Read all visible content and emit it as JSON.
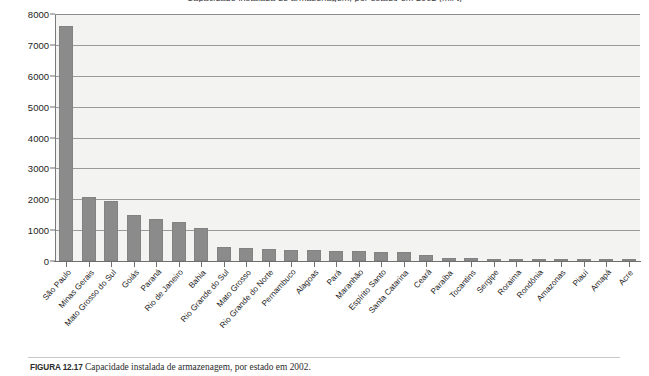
{
  "figure": {
    "title": "Capacidade instalada de armazenagem, por estado em 2002 (mil t)",
    "caption_label": "FIGURA 12.17",
    "caption_text": "Capacidade instalada de armazenagem, por estado em 2002."
  },
  "axes": {
    "y_ticks": [
      "8000",
      "7000",
      "6000",
      "5000",
      "4000",
      "3000",
      "2000",
      "1000",
      "0"
    ],
    "y_min": 0,
    "y_max": 8000,
    "y_step": 1000,
    "grid": true,
    "plot_background": "#f3f3f1",
    "bar_color": "#8b8b8b",
    "axis_color": "#6f6f6f"
  },
  "chart_data": {
    "type": "bar",
    "title": "Capacidade instalada de armazenagem, por estado em 2002 (mil t)",
    "xlabel": "",
    "ylabel": "",
    "ylim": [
      0,
      8000
    ],
    "grid": true,
    "legend": null,
    "categories": [
      "São Paulo",
      "Minas Gerais",
      "Mato Grosso do Sul",
      "Goiás",
      "Paraná",
      "Rio de Janeiro",
      "Bahia",
      "Rio Grande do Sul",
      "Mato Grosso",
      "Rio Grande do Norte",
      "Pernambuco",
      "Alagoas",
      "Pará",
      "Maranhão",
      "Espírito Santo",
      "Santa Catarina",
      "Ceará",
      "Paraíba",
      "Tocantins",
      "Sergipe",
      "Roraima",
      "Rondônia",
      "Amazonas",
      "Piauí",
      "Amapá",
      "Acre"
    ],
    "values": [
      7620,
      2060,
      1950,
      1500,
      1350,
      1260,
      1080,
      460,
      420,
      390,
      370,
      350,
      340,
      320,
      300,
      280,
      180,
      100,
      85,
      70,
      45,
      40,
      35,
      30,
      25,
      20
    ]
  }
}
